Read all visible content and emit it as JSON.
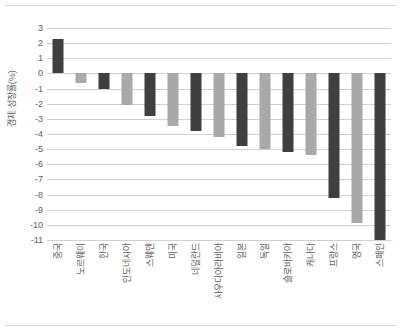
{
  "chart_data": {
    "type": "bar",
    "title": "",
    "xlabel": "",
    "ylabel": "경제 성장률(%)",
    "ylim": [
      -11,
      3
    ],
    "ytick_step": 1,
    "yticks": [
      3,
      2,
      1,
      0,
      -1,
      -2,
      -3,
      -4,
      -5,
      -6,
      -7,
      -8,
      -9,
      -10,
      -11
    ],
    "grid": true,
    "legend": "none",
    "categories": [
      "중국",
      "노르웨이",
      "한국",
      "인도네시아",
      "스웨덴",
      "미국",
      "네덜란드",
      "사우디아라비아",
      "일본",
      "독일",
      "슬로바키아",
      "캐나다",
      "프랑스",
      "영국",
      "스페인"
    ],
    "values": [
      2.3,
      -0.6,
      -1.0,
      -2.1,
      -2.8,
      -3.5,
      -3.8,
      -4.2,
      -4.8,
      -5.0,
      -5.2,
      -5.4,
      -8.2,
      -9.9,
      -11.0
    ],
    "bar_colors": [
      "#3f3f3f",
      "#a9a9a9",
      "#3f3f3f",
      "#a9a9a9",
      "#3f3f3f",
      "#a9a9a9",
      "#3f3f3f",
      "#a9a9a9",
      "#3f3f3f",
      "#a9a9a9",
      "#3f3f3f",
      "#a9a9a9",
      "#3f3f3f",
      "#a9a9a9",
      "#3f3f3f"
    ],
    "colors": {
      "dark_bar": "#3f3f3f",
      "light_bar": "#a9a9a9",
      "gridline": "#d0d0d0",
      "text": "#5e5e5e",
      "background": "#ffffff"
    }
  }
}
